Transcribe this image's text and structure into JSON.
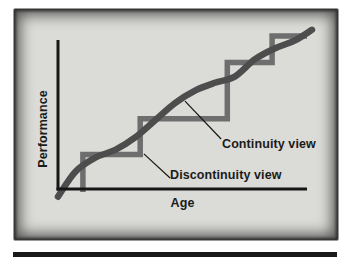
{
  "figure": {
    "panel_bg": "#dbdbd7",
    "frame_color": "#383838",
    "bottom_rule_color": "#1a1a1a"
  },
  "chart_data": {
    "type": "line",
    "title": "",
    "xlabel": "Age",
    "ylabel": "Performance",
    "axis_color": "#161616",
    "grid": false,
    "x_range": [
      0,
      1
    ],
    "y_range": [
      0,
      1
    ],
    "series": [
      {
        "name": "Discontinuity view",
        "style": "step",
        "color": "#6e6e6e",
        "stroke_width": 5.5,
        "points": [
          [
            0.1,
            0.0
          ],
          [
            0.1,
            0.24
          ],
          [
            0.33,
            0.24
          ],
          [
            0.33,
            0.47
          ],
          [
            0.68,
            0.47
          ],
          [
            0.68,
            0.83
          ],
          [
            0.86,
            0.83
          ],
          [
            0.86,
            1.0
          ],
          [
            1.0,
            1.0
          ]
        ]
      },
      {
        "name": "Continuity view",
        "style": "smooth",
        "color": "#4d4d4d",
        "stroke_width": 6.5,
        "points": [
          [
            0.0,
            -0.03
          ],
          [
            0.07,
            0.13
          ],
          [
            0.15,
            0.22
          ],
          [
            0.23,
            0.27
          ],
          [
            0.31,
            0.35
          ],
          [
            0.39,
            0.46
          ],
          [
            0.47,
            0.57
          ],
          [
            0.55,
            0.65
          ],
          [
            0.63,
            0.7
          ],
          [
            0.71,
            0.74
          ],
          [
            0.79,
            0.85
          ],
          [
            0.87,
            0.92
          ],
          [
            0.95,
            0.97
          ],
          [
            1.02,
            1.04
          ]
        ]
      }
    ],
    "annotations": [
      {
        "label": "Continuity view",
        "anchor": [
          0.51,
          0.583
        ],
        "end": [
          0.655,
          0.34
        ]
      },
      {
        "label": "Discontinuity view",
        "anchor": [
          0.345,
          0.244
        ],
        "end": [
          0.45,
          0.09
        ]
      }
    ],
    "legend": "none"
  }
}
